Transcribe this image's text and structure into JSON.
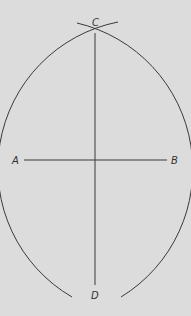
{
  "diagram": {
    "type": "geometric-construction",
    "colors": {
      "background": "#dcdcdc",
      "line": "#3a3a3a",
      "text": "#333333"
    },
    "points": [
      {
        "id": "A",
        "label": "A",
        "x": 24,
        "y": 160
      },
      {
        "id": "B",
        "label": "B",
        "x": 167,
        "y": 160
      },
      {
        "id": "C",
        "label": "C",
        "x": 95,
        "y": 33
      },
      {
        "id": "D",
        "label": "D",
        "x": 95,
        "y": 285
      }
    ],
    "segments": [
      {
        "from": "A",
        "to": "B"
      },
      {
        "from": "C",
        "to": "D"
      }
    ]
  }
}
